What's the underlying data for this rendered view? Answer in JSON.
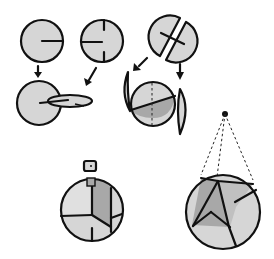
{
  "diagram": {
    "title": "",
    "colors": {
      "disc_fill": "#d6d6d6",
      "shade_fill": "#a8a8a8",
      "outline": "#111111",
      "background": "#ffffff"
    },
    "steps": [
      {
        "id": "disc-a",
        "label": "Disc with single slot from edge"
      },
      {
        "id": "disc-b",
        "label": "Disc with slot and two edge notches"
      },
      {
        "id": "disc-c",
        "label": "Disc cut in two halves with cross slot"
      },
      {
        "id": "assembly-1",
        "label": "Two discs interlocked"
      },
      {
        "id": "assembly-2",
        "label": "Half-discs added to form sphere"
      },
      {
        "id": "finished-clip",
        "label": "Finished sphere with hanger clip"
      },
      {
        "id": "finished-hanging",
        "label": "Finished sphere hung by strings"
      }
    ]
  }
}
